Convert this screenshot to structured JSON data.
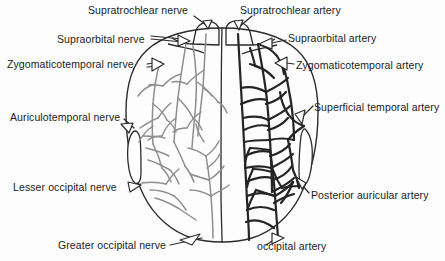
{
  "figure": {
    "kind": "anatomical-diagram",
    "left_half": "nerves",
    "right_half": "arteries",
    "colors": {
      "background": "#fdfdfd",
      "outline": "#2b2b2b",
      "nerve": "#8e8e8e",
      "artery": "#242424",
      "text": "#1b1b1b"
    }
  },
  "labels": {
    "supratrochlear_nerve": "Supratrochlear nerve",
    "supraorbital_nerve": "Supraorbital nerve",
    "zygomaticotemporal_nerve": "Zygomaticotemporal nerve",
    "auriculotemporal_nerve": "Auriculotemporal nerve",
    "lesser_occipital_nerve": "Lesser occipital nerve",
    "greater_occipital_nerve": "Greater occipital nerve",
    "supratrochlear_artery": "Supratrochlear artery",
    "supraorbital_artery": "Supraorbital artery",
    "zygomaticotemporal_artery": "Zygomaticotemporal artery",
    "superficial_temporal_artery": "Superficial temporal artery",
    "posterior_auricular_artery": "Posterior auricular artery",
    "occipital_artery": "occipital artery"
  }
}
